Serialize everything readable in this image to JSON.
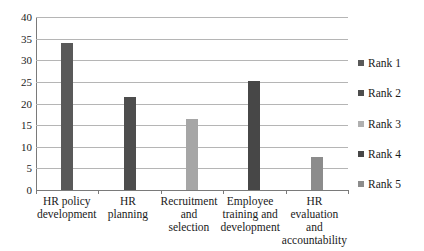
{
  "chart_data": {
    "type": "bar",
    "title": "",
    "subtitle": "",
    "xlabel": "",
    "ylabel": "",
    "ylim": [
      0,
      40
    ],
    "ytick_step": 5,
    "yticks": [
      "0",
      "5",
      "10",
      "15",
      "20",
      "25",
      "30",
      "35",
      "40"
    ],
    "grid": true,
    "legend_position": "right",
    "categories": [
      "HR policy development",
      "HR planning",
      "Recruitment and selection",
      "Employee training and development",
      "HR evaluation and accountability"
    ],
    "category_lines": [
      [
        "HR policy",
        "development"
      ],
      [
        "HR planning"
      ],
      [
        "Recruitment",
        "and selection"
      ],
      [
        "Employee",
        "training and",
        "development"
      ],
      [
        "HR evaluation",
        "and",
        "accountability"
      ]
    ],
    "values": [
      34.1,
      21.4,
      16.5,
      25.3,
      7.6
    ],
    "bar_colors": [
      "#595959",
      "#4d4d4d",
      "#a6a6a6",
      "#474747",
      "#8c8c8c"
    ],
    "series": [
      {
        "name": "Rank 1",
        "values": [
          34.1,
          null,
          null,
          null,
          null
        ]
      },
      {
        "name": "Rank 2",
        "values": [
          null,
          21.4,
          null,
          null,
          null
        ]
      },
      {
        "name": "Rank 3",
        "values": [
          null,
          null,
          16.5,
          null,
          null
        ]
      },
      {
        "name": "Rank 4",
        "values": [
          null,
          null,
          null,
          25.3,
          null
        ]
      },
      {
        "name": "Rank 5",
        "values": [
          null,
          null,
          null,
          null,
          7.6
        ]
      }
    ],
    "legend": [
      {
        "label": "Rank 1",
        "color": "#595959"
      },
      {
        "label": "Rank 2",
        "color": "#4d4d4d"
      },
      {
        "label": "Rank 3",
        "color": "#b0b0b0"
      },
      {
        "label": "Rank 4",
        "color": "#474747"
      },
      {
        "label": "Rank 5",
        "color": "#8c8c8c"
      }
    ],
    "colors": {
      "gridline": "#b5b5b5",
      "axis": "#7a7a7a",
      "text": "#1a1a1a",
      "background": "#ffffff"
    }
  }
}
